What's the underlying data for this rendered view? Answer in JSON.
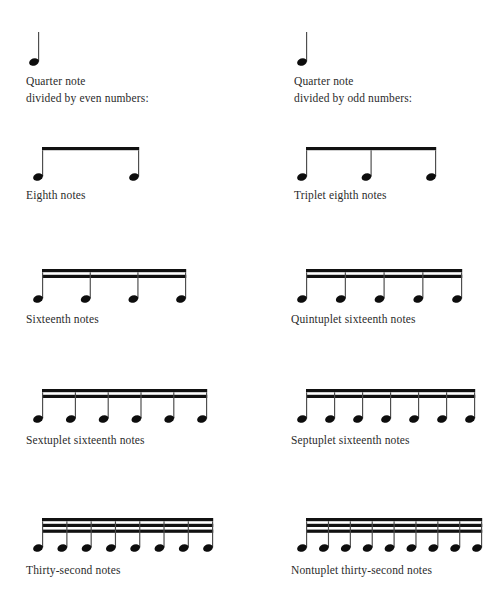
{
  "page": {
    "background_color": "#ffffff",
    "ink_color": "#111111"
  },
  "columns": [
    {
      "id": "even",
      "heading_line1": "Quarter note",
      "heading_line2": "divided by even numbers:",
      "rows": [
        {
          "id": "eighth",
          "label": "Eighth notes",
          "note_count": 2,
          "beams": 1
        },
        {
          "id": "sixteenth",
          "label": "Sixteenth notes",
          "note_count": 4,
          "beams": 2
        },
        {
          "id": "sextuplet",
          "label": "Sextuplet sixteenth notes",
          "note_count": 6,
          "beams": 2
        },
        {
          "id": "thirtysecond",
          "label": "Thirty-second notes",
          "note_count": 8,
          "beams": 3
        }
      ]
    },
    {
      "id": "odd",
      "heading_line1": "Quarter note",
      "heading_line2": "divided by odd numbers:",
      "rows": [
        {
          "id": "triplet",
          "label": "Triplet eighth notes",
          "note_count": 3,
          "beams": 1
        },
        {
          "id": "quintuplet",
          "label": "Quintuplet sixteenth notes",
          "note_count": 5,
          "beams": 2
        },
        {
          "id": "septuplet",
          "label": "Septuplet sixteenth notes",
          "note_count": 7,
          "beams": 2
        },
        {
          "id": "nontuplet",
          "label": "Nontuplet thirty-second notes",
          "note_count": 9,
          "beams": 3
        }
      ]
    }
  ],
  "quarter_note": {
    "icon": "quarter-note-icon",
    "stem_direction": "up",
    "beams": 0,
    "note_count": 1
  },
  "chart_data": {
    "type": "table",
    "columns": [
      "Even divisions",
      "Odd divisions"
    ],
    "rows": [
      {
        "even_label": "Eighth notes",
        "even_count": 2,
        "even_beams": 1,
        "odd_label": "Triplet eighth notes",
        "odd_count": 3,
        "odd_beams": 1
      },
      {
        "even_label": "Sixteenth notes",
        "even_count": 4,
        "even_beams": 2,
        "odd_label": "Quintuplet sixteenth notes",
        "odd_count": 5,
        "odd_beams": 2
      },
      {
        "even_label": "Sextuplet sixteenth notes",
        "even_count": 6,
        "even_beams": 2,
        "odd_label": "Septuplet sixteenth notes",
        "odd_count": 7,
        "odd_beams": 2
      },
      {
        "even_label": "Thirty-second notes",
        "even_count": 8,
        "even_beams": 3,
        "odd_label": "Nontuplet thirty-second notes",
        "odd_count": 9,
        "odd_beams": 3
      }
    ]
  }
}
